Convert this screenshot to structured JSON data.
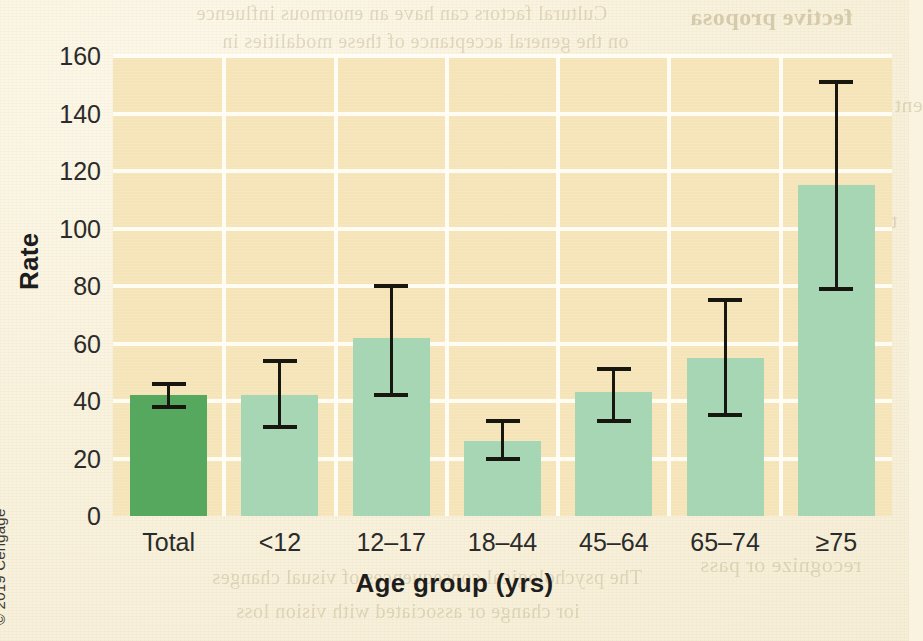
{
  "page": {
    "background_color": "#faf3df",
    "plot_background_color": "#f6e4b9",
    "gridline_color": "#fffdf5",
    "credit": "© 2019 Cengage"
  },
  "chart_data": {
    "type": "bar",
    "title": "",
    "xlabel": "Age group (yrs)",
    "ylabel": "Rate",
    "categories": [
      "Total",
      "<12",
      "12–17",
      "18–44",
      "45–64",
      "65–74",
      "≥75"
    ],
    "values": [
      42,
      42,
      62,
      26,
      43,
      55,
      115
    ],
    "error_low": [
      38,
      31,
      42,
      20,
      33,
      35,
      79
    ],
    "error_high": [
      46,
      54,
      80,
      33,
      51,
      75,
      151
    ],
    "ylim": [
      0,
      160
    ],
    "yticks": [
      0,
      20,
      40,
      60,
      80,
      100,
      120,
      140,
      160
    ],
    "ytick_labels": [
      "0",
      "20",
      "40",
      "60",
      "80",
      "100",
      "120",
      "140",
      "160"
    ],
    "grid": true,
    "legend": "none",
    "bar_colors": [
      "#56a85f",
      "#a6d6b3",
      "#a6d6b3",
      "#a6d6b3",
      "#a6d6b3",
      "#a6d6b3",
      "#a6d6b3"
    ],
    "highlight_category": "Total",
    "highlight_color": "#56a85f",
    "series_color": "#a6d6b3",
    "errorbar_color": "#18170f"
  },
  "bleed_text": {
    "items": [
      {
        "text": "Cultural factors can have an enormous influence",
        "x": 196,
        "y": 2,
        "size": 20,
        "bold": false
      },
      {
        "text": "fective proposa",
        "x": 690,
        "y": 4,
        "size": 24,
        "bold": true
      },
      {
        "text": "on the general acceptance of these modalities in",
        "x": 222,
        "y": 30,
        "size": 20,
        "bold": false
      },
      {
        "text": "society.",
        "x": 398,
        "y": 86,
        "size": 20,
        "bold": false
      },
      {
        "text": "ent activities are based on",
        "x": 682,
        "y": 92,
        "size": 22,
        "bold": false
      },
      {
        "text": "Spiritual beliefs can have an important impact",
        "x": 208,
        "y": 118,
        "size": 20,
        "bold": false
      },
      {
        "text": "ing, specific disea",
        "x": 700,
        "y": 124,
        "size": 22,
        "bold": false
      },
      {
        "text": "and have important psychological consequences,",
        "x": 208,
        "y": 140,
        "size": 20,
        "bold": false
      },
      {
        "text": "that are geared to",
        "x": 706,
        "y": 152,
        "size": 22,
        "bold": false
      },
      {
        "text": "especially near the time of death.",
        "x": 284,
        "y": 170,
        "size": 20,
        "bold": false
      },
      {
        "text": "making the best",
        "x": 716,
        "y": 180,
        "size": 22,
        "bold": false
      },
      {
        "text": "ting self-management",
        "x": 696,
        "y": 208,
        "size": 22,
        "bold": false
      },
      {
        "text": "8.2  Sensory Systems",
        "x": 330,
        "y": 230,
        "size": 21,
        "bold": true
      },
      {
        "text": "What age-related changes occur in vision?",
        "x": 248,
        "y": 268,
        "size": 20,
        "bold": false
      },
      {
        "text": "tal for informatio",
        "x": 700,
        "y": 272,
        "size": 22,
        "bold": false
      },
      {
        "text": "Several age-related changes occur in the structure",
        "x": 222,
        "y": 292,
        "size": 20,
        "bold": false
      },
      {
        "text": "uring?",
        "x": 744,
        "y": 300,
        "size": 22,
        "bold": false
      },
      {
        "text": "of the eye, including decreased flexibility in the",
        "x": 228,
        "y": 318,
        "size": 20,
        "bold": false
      },
      {
        "text": "e transition from h",
        "x": 694,
        "y": 324,
        "size": 22,
        "bold": false
      },
      {
        "text": "cornea, yellowing and increasing opacification of",
        "x": 222,
        "y": 344,
        "size": 20,
        "bold": false
      },
      {
        "text": "be followed by a",
        "x": 712,
        "y": 348,
        "size": 22,
        "bold": false
      },
      {
        "text": "the lens, and changes in the retina. These changes",
        "x": 218,
        "y": 370,
        "size": 20,
        "bold": false
      },
      {
        "text": "a more integrate",
        "x": 710,
        "y": 374,
        "size": 22,
        "bold": false
      },
      {
        "text": "mainly affect the ability to adjust to changes in",
        "x": 228,
        "y": 396,
        "size": 20,
        "bold": false
      },
      {
        "text": "mbulatory settin",
        "x": 704,
        "y": 400,
        "size": 22,
        "bold": false
      },
      {
        "text": "light, maintain color discrimination, and focus.",
        "x": 226,
        "y": 422,
        "size": 20,
        "bold": false
      },
      {
        "text": "Several diseases cause changes in vision, deper",
        "x": 226,
        "y": 448,
        "size": 20,
        "bold": false
      },
      {
        "text": "including cataracts, Diabetes mellitus, glaucoma",
        "x": 218,
        "y": 474,
        "size": 20,
        "bold": false
      },
      {
        "text": "e change with age",
        "x": 702,
        "y": 486,
        "size": 22,
        "bold": true
      },
      {
        "text": "recognize or pass",
        "x": 700,
        "y": 552,
        "size": 22,
        "bold": false
      },
      {
        "text": "The psychological consequences of visual changes",
        "x": 212,
        "y": 566,
        "size": 20,
        "bold": false
      },
      {
        "text": "ior change or associated with vision loss",
        "x": 236,
        "y": 600,
        "size": 20,
        "bold": false
      }
    ]
  }
}
